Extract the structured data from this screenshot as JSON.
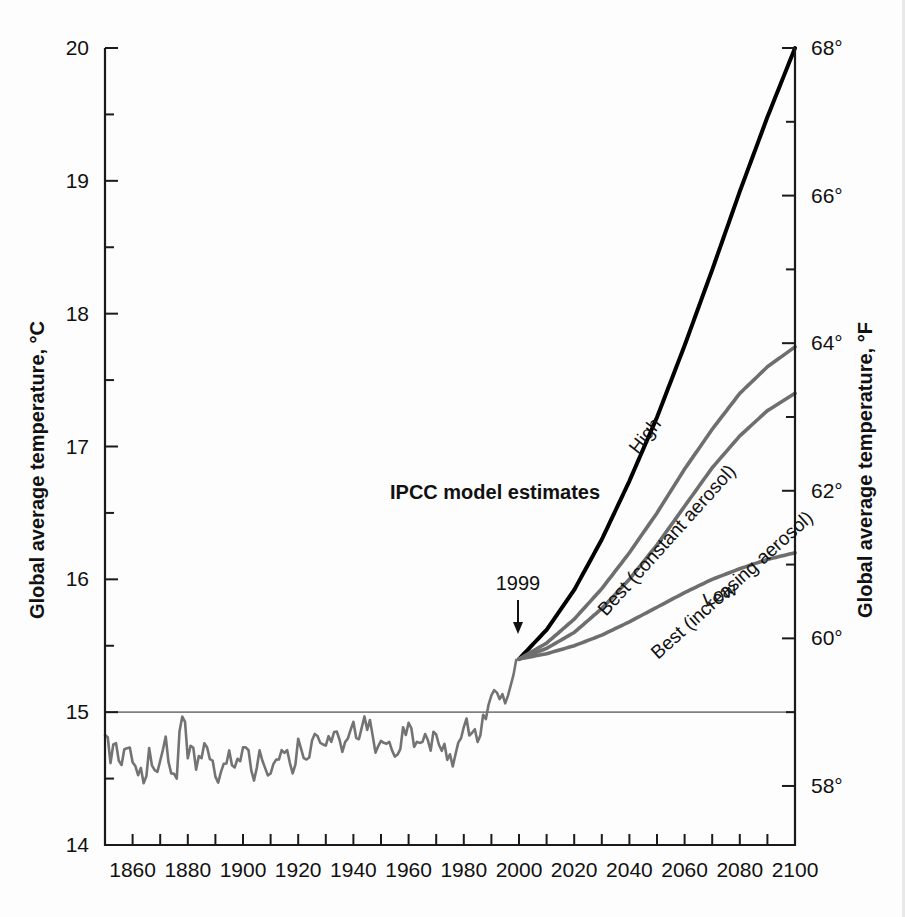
{
  "figure": {
    "name": "ipcc-global-average-temperature-projection"
  },
  "axes": {
    "left": {
      "title": "Global average temperature, °C",
      "ticks": [
        "20",
        "19",
        "18",
        "17",
        "16",
        "15",
        "14"
      ],
      "values": [
        20,
        19,
        18,
        17,
        16,
        15,
        14
      ],
      "min": 14,
      "max": 20,
      "minor_step": 0.5
    },
    "right": {
      "title": "Global average temperature, °F",
      "ticks": [
        "68°",
        "66°",
        "64°",
        "62°",
        "60°",
        "58°"
      ],
      "values": [
        68,
        66,
        64,
        62,
        60,
        58
      ],
      "min": 57.2,
      "max": 68
    },
    "bottom": {
      "ticks": [
        "1860",
        "1880",
        "1900",
        "1920",
        "1940",
        "1960",
        "1980",
        "2000",
        "2020",
        "2040",
        "2060",
        "2080",
        "2100"
      ],
      "values": [
        1860,
        1880,
        1900,
        1920,
        1940,
        1960,
        1980,
        2000,
        2020,
        2040,
        2060,
        2080,
        2100
      ],
      "min": 1850,
      "max": 2100,
      "minor_step": 10
    }
  },
  "annotations": {
    "model_estimates": "IPCC model estimates",
    "observation_marker": "1999",
    "gridline_value": "15"
  },
  "colors": {
    "high_curve": "#000000",
    "projection_gray": "#6e6e6e",
    "historical_gray": "#737373",
    "axis": "#1a1a1a",
    "gridline": "#808080",
    "background": "#fdfdfd"
  },
  "chart_data": {
    "type": "line",
    "title": "",
    "xlabel": "",
    "ylabel": "Global average temperature, °C",
    "xlim": [
      1850,
      2100
    ],
    "ylim": [
      14,
      20
    ],
    "grid": "single horizontal gridline at 15 °C",
    "legend": "inline curve labels at right",
    "series": [
      {
        "name": "Observed global average temperature",
        "label": "",
        "color": "#737373",
        "type": "historical",
        "x": [
          1850,
          1852,
          1854,
          1856,
          1858,
          1860,
          1862,
          1864,
          1866,
          1868,
          1870,
          1872,
          1874,
          1876,
          1878,
          1880,
          1882,
          1884,
          1886,
          1888,
          1890,
          1892,
          1894,
          1896,
          1898,
          1900,
          1902,
          1904,
          1906,
          1908,
          1910,
          1912,
          1914,
          1916,
          1918,
          1920,
          1922,
          1924,
          1926,
          1928,
          1930,
          1932,
          1934,
          1936,
          1938,
          1940,
          1942,
          1944,
          1946,
          1948,
          1950,
          1952,
          1954,
          1956,
          1958,
          1960,
          1962,
          1964,
          1966,
          1968,
          1970,
          1972,
          1974,
          1976,
          1978,
          1980,
          1982,
          1984,
          1986,
          1988,
          1990,
          1992,
          1994,
          1996,
          1998,
          1999
        ],
        "y": [
          14.83,
          14.62,
          14.8,
          14.55,
          14.72,
          14.58,
          14.5,
          14.52,
          14.68,
          14.58,
          14.64,
          14.73,
          14.6,
          14.55,
          14.99,
          14.7,
          14.66,
          14.6,
          14.68,
          14.62,
          14.58,
          14.53,
          14.6,
          14.68,
          14.62,
          14.72,
          14.64,
          14.55,
          14.66,
          14.56,
          14.6,
          14.58,
          14.74,
          14.66,
          14.6,
          14.72,
          14.7,
          14.68,
          14.8,
          14.74,
          14.8,
          14.78,
          14.82,
          14.78,
          14.88,
          14.9,
          14.88,
          15.0,
          14.86,
          14.78,
          14.72,
          14.82,
          14.74,
          14.68,
          14.82,
          14.84,
          14.82,
          14.7,
          14.8,
          14.72,
          14.84,
          14.76,
          14.7,
          14.66,
          14.76,
          14.92,
          14.84,
          14.82,
          14.88,
          15.02,
          15.12,
          15.06,
          15.14,
          15.1,
          15.3,
          15.4
        ]
      },
      {
        "name": "High",
        "label": "High",
        "color": "#000000",
        "type": "projection",
        "x": [
          2000,
          2010,
          2020,
          2030,
          2040,
          2050,
          2060,
          2070,
          2080,
          2090,
          2100
        ],
        "y": [
          15.4,
          15.62,
          15.92,
          16.3,
          16.74,
          17.22,
          17.76,
          18.33,
          18.92,
          19.48,
          20.0
        ]
      },
      {
        "name": "Best (constant aerosol)",
        "label": "Best (constant aerosol)",
        "color": "#6e6e6e",
        "type": "projection",
        "x": [
          2000,
          2010,
          2020,
          2030,
          2040,
          2050,
          2060,
          2070,
          2080,
          2090,
          2100
        ],
        "y": [
          15.4,
          15.52,
          15.7,
          15.93,
          16.2,
          16.5,
          16.83,
          17.13,
          17.4,
          17.6,
          17.75
        ]
      },
      {
        "name": "Best (increasing aerosol)",
        "label": "Best (increasing aerosol)",
        "color": "#6e6e6e",
        "type": "projection",
        "x": [
          2000,
          2010,
          2020,
          2030,
          2040,
          2050,
          2060,
          2070,
          2080,
          2090,
          2100
        ],
        "y": [
          15.4,
          15.48,
          15.6,
          15.78,
          16.0,
          16.26,
          16.55,
          16.84,
          17.08,
          17.27,
          17.4
        ]
      },
      {
        "name": "Low",
        "label": "Low",
        "color": "#6e6e6e",
        "type": "projection",
        "x": [
          2000,
          2010,
          2020,
          2030,
          2040,
          2050,
          2060,
          2070,
          2080,
          2090,
          2100
        ],
        "y": [
          15.4,
          15.44,
          15.5,
          15.58,
          15.68,
          15.79,
          15.9,
          16.0,
          16.08,
          16.15,
          16.2
        ]
      }
    ],
    "annotations": [
      {
        "text": "IPCC model estimates",
        "x": 1975,
        "y": 16.55
      },
      {
        "text": "1999",
        "x": 1997,
        "y": 15.85
      }
    ]
  }
}
